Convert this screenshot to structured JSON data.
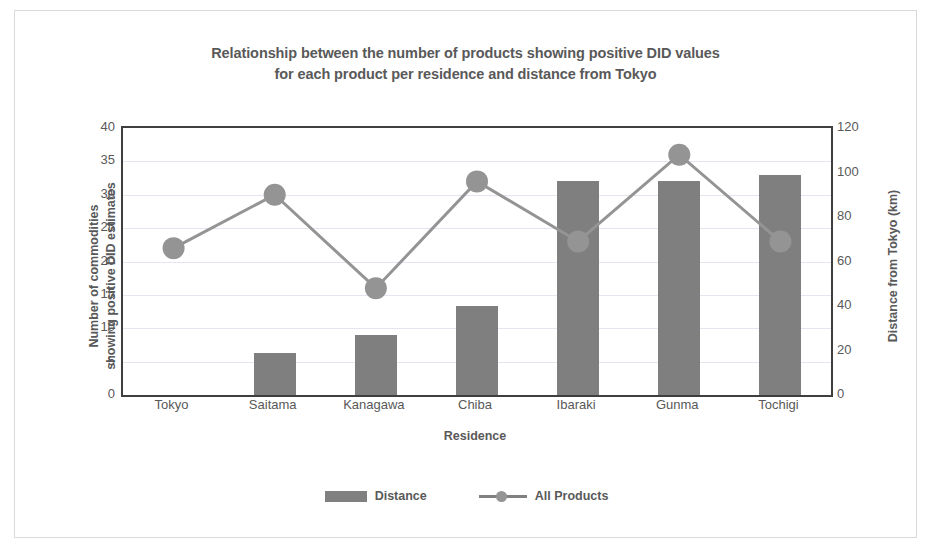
{
  "chart_data": {
    "type": "bar",
    "title": "Relationship between the number of products showing positive DID values for each product per residence and distance from Tokyo",
    "title_lines": [
      "Relationship between the number of products showing positive DID values",
      "for each product per residence and distance from Tokyo"
    ],
    "categories": [
      "Tokyo",
      "Saitama",
      "Kanagawa",
      "Chiba",
      "Ibaraki",
      "Gunma",
      "Tochigi"
    ],
    "xlabel": "Residence",
    "ylabel": "Number of commodities showing positive DID estimates",
    "ylabel_lines": [
      "Number of commodities",
      "showing positive DID estimates"
    ],
    "ylabel_secondary": "Distance from Tokyo (km)",
    "ylim": [
      0,
      40
    ],
    "yticks": [
      0,
      5,
      10,
      15,
      20,
      25,
      30,
      35,
      40
    ],
    "ylim_secondary": [
      0,
      120
    ],
    "yticks_secondary": [
      0,
      20,
      40,
      60,
      80,
      100,
      120
    ],
    "grid": true,
    "legend_position": "bottom",
    "series": [
      {
        "name": "Distance",
        "kind": "bar",
        "axis": "secondary",
        "unit": "km",
        "color": "#7f7f7f",
        "values": [
          0,
          19,
          27,
          40,
          96,
          96,
          99
        ]
      },
      {
        "name": "All Products",
        "kind": "line",
        "axis": "primary",
        "color": "#949494",
        "marker": "circle",
        "values": [
          22,
          30,
          16,
          32,
          23,
          36,
          23
        ]
      }
    ]
  },
  "legend": {
    "items": [
      {
        "label": "Distance",
        "type": "bar-swatch"
      },
      {
        "label": "All Products",
        "type": "line-marker-swatch"
      }
    ]
  },
  "colors": {
    "bar": "#7f7f7f",
    "line": "#949494",
    "text": "#595959",
    "axis": "#3f3f3f",
    "grid": "#e8e4ef",
    "frame": "#d9d9d9",
    "background": "#ffffff"
  }
}
